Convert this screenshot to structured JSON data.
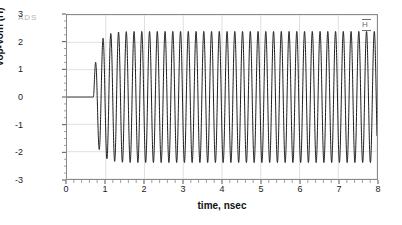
{
  "watermark": {
    "text": "ADS"
  },
  "marker": {
    "label": "H"
  },
  "chart_data": {
    "type": "line",
    "title": "",
    "xlabel": "time, nsec",
    "ylabel": "Vop-Vom (H)",
    "xlim": [
      0,
      8
    ],
    "ylim": [
      -3,
      3
    ],
    "xticks": [
      0,
      1,
      2,
      3,
      4,
      5,
      6,
      7,
      8
    ],
    "xtick_labels": [
      "0",
      "1",
      "2",
      "3",
      "4",
      "5",
      "6",
      "7",
      "8"
    ],
    "yticks": [
      3,
      2,
      1,
      0,
      -1,
      -2,
      -3
    ],
    "ytick_labels": [
      "3",
      "2",
      "1",
      "0",
      "-1",
      "-2",
      "-3"
    ],
    "x_minor_interval": 0.2,
    "y_minor_interval": 0.25,
    "grid": true,
    "grid_color": "#d8d8d8",
    "frame_color": "#8a8a8a",
    "legend": null,
    "series": [
      {
        "name": "Vop-Vom",
        "color": "#1a1a1a",
        "line_width": 1.0,
        "description": "Differential oscillator startup: output held at 0 V until start-up at ~0.68 nsec, one partial first peak reaching about 1.3 V, then steady-state sinusoidal oscillation with amplitude about +/-2.4 V at roughly 5 GHz for the remainder of the 8 nsec window.",
        "waveform": {
          "quiescent_value": 0.0,
          "start_time_ns": 0.68,
          "first_peak_value": 1.3,
          "steady_amplitude": 2.4,
          "steady_peak_value": 2.4,
          "steady_trough_value": -2.4,
          "frequency_ghz": 5.0,
          "period_ns": 0.2,
          "settle_time_ns": 0.95,
          "dc_offset": 0.0,
          "cycles_visible": 37
        }
      }
    ]
  }
}
